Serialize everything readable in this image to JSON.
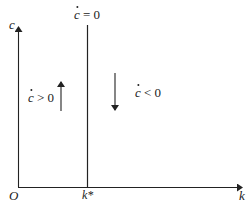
{
  "figure": {
    "axes": {
      "y_label": "c",
      "x_label": "k",
      "origin_label": "O",
      "x_tick_label": "k*"
    },
    "locus": {
      "label_var": "c",
      "label_rel": "= 0"
    },
    "regions": {
      "left": {
        "label_var": "c",
        "label_rel": "> 0",
        "arrow": "up"
      },
      "right": {
        "label_var": "c",
        "label_rel": "< 0",
        "arrow": "down"
      }
    },
    "caption": ""
  },
  "colors": {
    "ink": "#222222",
    "background": "#ffffff"
  }
}
